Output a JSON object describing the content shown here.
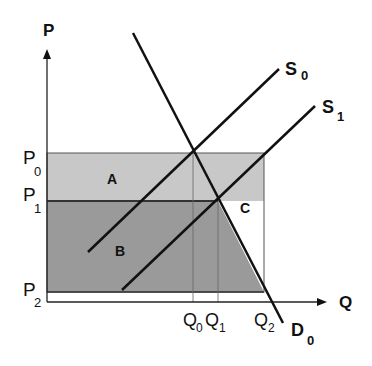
{
  "axes": {
    "y_label": "P",
    "x_label": "Q"
  },
  "price_levels": [
    {
      "main": "P",
      "sub": "0"
    },
    {
      "main": "P",
      "sub": "1"
    },
    {
      "main": "P",
      "sub": "2"
    }
  ],
  "quantity_levels": [
    {
      "main": "Q",
      "sub": "0"
    },
    {
      "main": "Q",
      "sub": "1"
    },
    {
      "main": "Q",
      "sub": "2"
    }
  ],
  "curves": {
    "supply_0": {
      "main": "S",
      "sub": "0"
    },
    "supply_1": {
      "main": "S",
      "sub": "1"
    },
    "demand_0": {
      "main": "D",
      "sub": "0"
    }
  },
  "regions": {
    "a": "A",
    "b": "B",
    "c": "C"
  },
  "colors": {
    "region_a": "#c8c8c8",
    "region_b": "#9a9a9a",
    "lines": "#111111"
  }
}
